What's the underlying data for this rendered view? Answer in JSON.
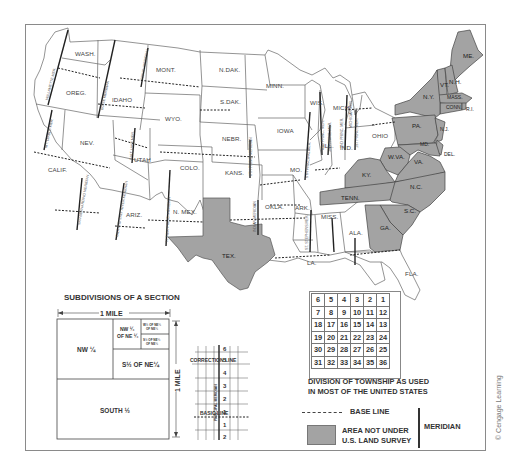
{
  "map": {
    "title": "U.S. Public Land Survey System",
    "states": {
      "unshaded": [
        "WASH.",
        "OREG.",
        "CALIF.",
        "NEV.",
        "IDAHO",
        "MONT.",
        "WYO.",
        "UTAH",
        "COLO.",
        "ARIZ.",
        "N. MEX.",
        "N.DAK.",
        "S.DAK.",
        "NEBR.",
        "KANS.",
        "OKLA.",
        "MINN.",
        "IOWA",
        "MO.",
        "ARK.",
        "LA.",
        "WIS.",
        "MICH.",
        "ILL.",
        "IND.",
        "OHIO",
        "MISS.",
        "ALA.",
        "FLA."
      ],
      "shaded": [
        "TEX.",
        "ME.",
        "VT.",
        "N.H.",
        "MASS.",
        "CONN.",
        "R.I.",
        "N.Y.",
        "PA.",
        "N.J.",
        "DEL.",
        "MD.",
        "W.VA.",
        "VA.",
        "KY.",
        "TENN.",
        "N.C.",
        "S.C.",
        "GA."
      ]
    },
    "meridian_labels": [
      "WILLAMETTE MER.",
      "BOISE MERIDIAN",
      "PRINC. MERIDIAN",
      "MT. DIABLO MER.",
      "SALT LAKE MER.",
      "SAN BERNARDINO MERIDIAN",
      "GILA AND SALT RIVER MERIDIAN",
      "N. MEX. PRINC. MERIDIAN",
      "6TH PRINC. MERIDIAN",
      "INDIAN MERIDIAN",
      "5TH PRINCIPAL MER.",
      "4TH PRINC. MER.",
      "3RD PRINC. MER.",
      "2ND PRINC. MER.",
      "1ST PRINC. MER.",
      "MICHIGAN MER.",
      "ST. STEPHENS MER."
    ]
  },
  "section_diagram": {
    "title": "SUBDIVISIONS OF A SECTION",
    "width_label": "1 MILE",
    "height_label": "1 MILE",
    "parcels": {
      "nw_quarter": "NW ¼",
      "nw_of_ne": "NW ¼",
      "nw_of_ne_2": "OF NE ¼",
      "w_half_ne_nw": "W½ OF NE¼",
      "w_half_ne_nw_2": "OF NE¼",
      "s_half_ne_nw": "S½ OF NE¼",
      "s_half_ne_nw_2": "OF NE¼",
      "s_half_ne": "S½ OF NE¼",
      "south_half": "SOUTH ½"
    }
  },
  "grid_diagram": {
    "correction_line": "CORRECTION LINE",
    "basic_line": "BASIC LINE",
    "principal_meridian": "PRINCIPAL MERIDIAN",
    "north_tiers": [
      "6",
      "5",
      "4",
      "3",
      "2",
      "1"
    ],
    "south_tiers": [
      "1",
      "2"
    ]
  },
  "township": {
    "rows": [
      [
        "6",
        "5",
        "4",
        "3",
        "2",
        "1"
      ],
      [
        "7",
        "8",
        "9",
        "10",
        "11",
        "12"
      ],
      [
        "18",
        "17",
        "16",
        "15",
        "14",
        "13"
      ],
      [
        "19",
        "20",
        "21",
        "22",
        "23",
        "24"
      ],
      [
        "30",
        "29",
        "28",
        "27",
        "26",
        "25"
      ],
      [
        "31",
        "32",
        "33",
        "34",
        "35",
        "36"
      ]
    ],
    "caption_line1": "DIVISION OF TOWNSHIP AS USED",
    "caption_line2": "IN MOST OF THE UNITED STATES"
  },
  "legend": {
    "base_line": "BASE LINE",
    "area_not_under_1": "AREA NOT UNDER",
    "area_not_under_2": "U.S. LAND SURVEY",
    "meridian": "MERIDIAN"
  },
  "colors": {
    "shaded_state": "#a3a3a3",
    "border": "#555555",
    "meridian_line": "#222222"
  },
  "credit": "© Cengage Learning"
}
